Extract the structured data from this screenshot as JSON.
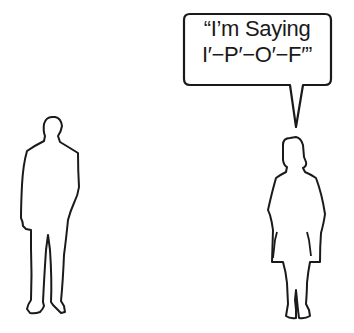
{
  "speech_bubble": {
    "lines": [
      "“I’m Saying",
      "I′−P′−O′−F′”"
    ],
    "speaker": "woman"
  },
  "figures": [
    {
      "name": "man",
      "style": "outline"
    },
    {
      "name": "woman",
      "style": "outline"
    }
  ],
  "colors": {
    "stroke": "#1a1a1a",
    "background": "#ffffff"
  }
}
